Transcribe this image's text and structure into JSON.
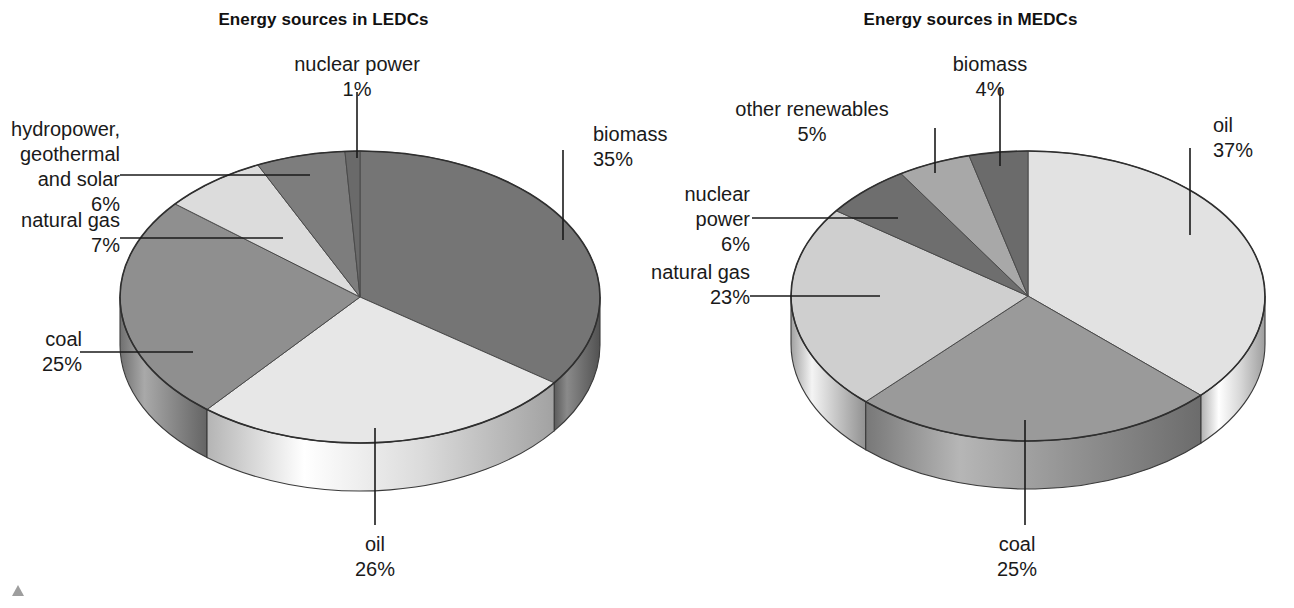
{
  "figure": {
    "background": "#ffffff",
    "corner_mark": "triangle-marker"
  },
  "panels": [
    {
      "id": "ledc",
      "title": "Energy sources in LEDCs"
    },
    {
      "id": "medc",
      "title": "Energy sources in MEDCs"
    }
  ],
  "labels": {
    "ledc": {
      "nuclear_name": "nuclear power",
      "nuclear_pct": "1%",
      "hydro_l1": "hydropower,",
      "hydro_l2": "geothermal",
      "hydro_l3": "and solar",
      "hydro_pct": "6%",
      "gas_name": "natural gas",
      "gas_pct": "7%",
      "coal_name": "coal",
      "coal_pct": "25%",
      "oil_name": "oil",
      "oil_pct": "26%",
      "biomass_name": "biomass",
      "biomass_pct": "35%"
    },
    "medc": {
      "biomass_name": "biomass",
      "biomass_pct": "4%",
      "renew_name": "other renewables",
      "renew_pct": "5%",
      "nuclear_l1": "nuclear",
      "nuclear_l2": "power",
      "nuclear_pct": "6%",
      "gas_name": "natural gas",
      "gas_pct": "23%",
      "coal_name": "coal",
      "coal_pct": "25%",
      "oil_name": "oil",
      "oil_pct": "37%"
    }
  },
  "chart_data": [
    {
      "type": "pie",
      "title": "Energy sources in LEDCs",
      "three_d": true,
      "start_angle_deg": 0,
      "direction": "clockwise",
      "units": "percent",
      "total": 100,
      "labels": [
        "biomass",
        "oil",
        "coal",
        "natural gas",
        "hydropower, geothermal and solar",
        "nuclear power"
      ],
      "values": [
        35,
        26,
        25,
        7,
        6,
        1
      ],
      "colors": [
        "#757575",
        "#e7e7e7",
        "#8f8f8f",
        "#dcdcdc",
        "#7d7d7d",
        "#6a6a6a"
      ],
      "legend": "none",
      "annotations": [
        "biomass 35%",
        "oil 26%",
        "coal 25%",
        "natural gas 7%",
        "hydropower, geothermal and solar 6%",
        "nuclear power 1%"
      ]
    },
    {
      "type": "pie",
      "title": "Energy sources in MEDCs",
      "three_d": true,
      "start_angle_deg": 0,
      "direction": "clockwise",
      "units": "percent",
      "total": 100,
      "labels": [
        "oil",
        "coal",
        "natural gas",
        "nuclear power",
        "other renewables",
        "biomass"
      ],
      "values": [
        37,
        25,
        23,
        6,
        5,
        4
      ],
      "colors": [
        "#e2e2e2",
        "#9a9a9a",
        "#cfcfcf",
        "#6e6e6e",
        "#a8a8a8",
        "#6b6b6b"
      ],
      "legend": "none",
      "annotations": [
        "oil 37%",
        "coal 25%",
        "natural gas 23%",
        "nuclear power 6%",
        "other renewables 5%",
        "biomass 4%"
      ]
    }
  ]
}
